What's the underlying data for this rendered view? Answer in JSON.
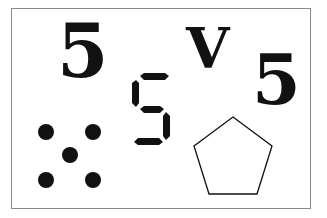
{
  "figure": {
    "theme": "representations of the number five",
    "items": {
      "numeral_large": {
        "text": "5"
      },
      "roman_numeral": {
        "text": "V"
      },
      "numeral_small": {
        "text": "5"
      },
      "seven_segment": {
        "digit": "5",
        "segments_on": [
          "top",
          "upper-left",
          "middle",
          "lower-right",
          "bottom"
        ]
      },
      "dice_pips": {
        "count": 5
      },
      "pentagon": {
        "sides": 5
      }
    },
    "colors": {
      "ink": "#111111",
      "border": "#8a8a8a",
      "background": "#ffffff"
    }
  }
}
